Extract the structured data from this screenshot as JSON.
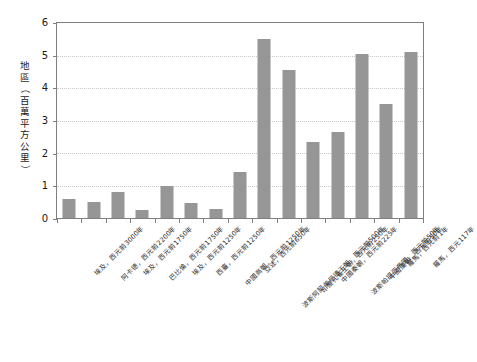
{
  "axes": {
    "y_title": "地區（百萬平方公里）",
    "y_title_chars": [
      "地",
      "區",
      "（",
      "百",
      "萬",
      "平",
      "方",
      "公",
      "里",
      "）"
    ],
    "y_ticks": [
      "0",
      "1",
      "2",
      "3",
      "4",
      "5",
      "6"
    ]
  },
  "colors": {
    "bar_fill": "#969696",
    "axis_line": "#7f7f7f",
    "gridline": "#c8c8c8",
    "background": "#ffffff",
    "text": "#1a1a1a"
  },
  "chart_data": {
    "type": "bar",
    "title": "",
    "xlabel": "",
    "ylabel": "地區（百萬平方公里）",
    "ylim": [
      0,
      6
    ],
    "ytick_values": [
      0,
      1,
      2,
      3,
      4,
      5,
      6
    ],
    "grid": true,
    "legend": "none",
    "categories": [
      "埃及，西元前3000年",
      "阿卡德，西元前2200年",
      "埃及，西元前1750年",
      "巴比倫，西元前1750年",
      "埃及，西元前1250年",
      "西臺，西元前1250年",
      "中國商朝，西元前1250年",
      "亞述，西元前650年",
      "波斯阿契美尼德王朝，西元前500年",
      "印度孔雀王朝，西元前250年",
      "中國秦朝，西元前225年",
      "波斯帕提亞帝國，西元前50年",
      "中國漢朝，西元前50年",
      "羅馬，西元前1年",
      "羅馬，西元117年"
    ],
    "values": [
      0.6,
      0.5,
      0.8,
      0.25,
      1.0,
      0.45,
      0.27,
      1.42,
      5.5,
      4.55,
      2.35,
      2.65,
      5.05,
      3.5,
      5.1
    ]
  }
}
